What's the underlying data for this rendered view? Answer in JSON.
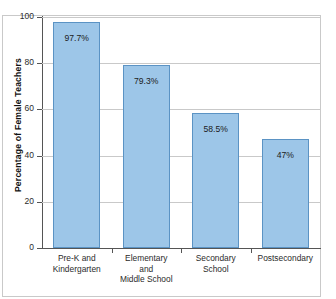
{
  "chart_data": {
    "type": "bar",
    "title": "",
    "xlabel": "",
    "ylabel": "Percentage of Female Teachers",
    "ylim": [
      0,
      100
    ],
    "yticks": [
      0,
      20,
      40,
      60,
      80,
      100
    ],
    "grid": true,
    "legend": "none",
    "categories": [
      "Pre-K and Kindergarten",
      "Elementary and Middle School",
      "Secondary School",
      "Postsecondary"
    ],
    "category_lines": [
      [
        "Pre-K and",
        "Kindergarten"
      ],
      [
        "Elementary",
        "and",
        "Middle School"
      ],
      [
        "Secondary",
        "School"
      ],
      [
        "Postsecondary"
      ]
    ],
    "values": [
      97.7,
      79.3,
      58.5,
      47
    ],
    "value_labels": [
      "97.7%",
      "79.3%",
      "58.5%",
      "47%"
    ],
    "bar_color": "#9dc6e8",
    "bar_edge_color": "#5b93c4",
    "grid_color": "#c9c9c9",
    "axis_color": "#555555"
  }
}
